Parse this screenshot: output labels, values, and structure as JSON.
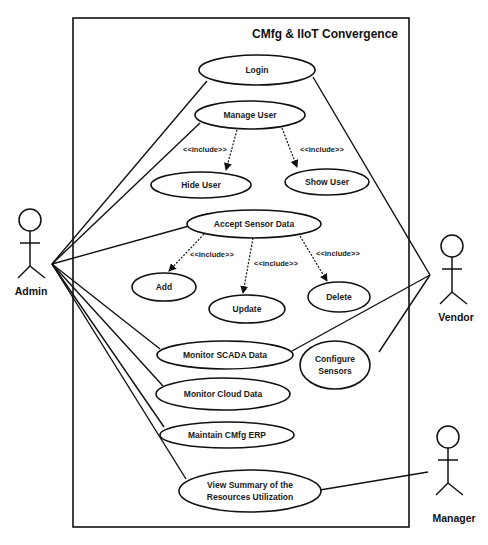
{
  "diagram": {
    "title": "CMfg & IIoT Convergence",
    "stroke_color": "#111111",
    "background": "#ffffff",
    "system_boundary": {
      "x": 73,
      "y": 18,
      "width": 336,
      "height": 509
    },
    "actors": [
      {
        "id": "admin",
        "label": "Admin",
        "head": {
          "cx": 30,
          "cy": 220
        },
        "label_pos": {
          "x": 31,
          "y": 295
        }
      },
      {
        "id": "vendor",
        "label": "Vendor",
        "head": {
          "cx": 452,
          "cy": 246
        },
        "label_pos": {
          "x": 456,
          "y": 321
        }
      },
      {
        "id": "manager",
        "label": "Manager",
        "head": {
          "cx": 448,
          "cy": 437
        },
        "label_pos": {
          "x": 454,
          "y": 522
        }
      }
    ],
    "use_cases": [
      {
        "id": "login",
        "label": "Login",
        "lines": [
          "Login"
        ],
        "cx": 257,
        "cy": 70,
        "rx": 58,
        "ry": 15
      },
      {
        "id": "manage_user",
        "label": "Manage User",
        "lines": [
          "Manage User"
        ],
        "cx": 250,
        "cy": 115,
        "rx": 55,
        "ry": 14
      },
      {
        "id": "hide_user",
        "label": "Hide User",
        "lines": [
          "Hide User"
        ],
        "cx": 201,
        "cy": 185,
        "rx": 50,
        "ry": 13
      },
      {
        "id": "show_user",
        "label": "Show User",
        "lines": [
          "Show User"
        ],
        "cx": 327,
        "cy": 182,
        "rx": 42,
        "ry": 13
      },
      {
        "id": "accept_sensor_data",
        "label": "Accept Sensor Data",
        "lines": [
          "Accept Sensor Data"
        ],
        "cx": 254,
        "cy": 224,
        "rx": 67,
        "ry": 14
      },
      {
        "id": "add",
        "label": "Add",
        "lines": [
          "Add"
        ],
        "cx": 164,
        "cy": 287,
        "rx": 32,
        "ry": 14
      },
      {
        "id": "update",
        "label": "Update",
        "lines": [
          "Update"
        ],
        "cx": 247,
        "cy": 309,
        "rx": 38,
        "ry": 14
      },
      {
        "id": "delete",
        "label": "Delete",
        "lines": [
          "Delete"
        ],
        "cx": 339,
        "cy": 297,
        "rx": 31,
        "ry": 15
      },
      {
        "id": "monitor_scada",
        "label": "Monitor SCADA Data",
        "lines": [
          "Monitor SCADA Data"
        ],
        "cx": 225,
        "cy": 355,
        "rx": 68,
        "ry": 14
      },
      {
        "id": "configure_sensors",
        "label": "Configure Sensors",
        "lines": [
          "Configure",
          "Sensors"
        ],
        "cx": 335,
        "cy": 365,
        "rx": 35,
        "ry": 24
      },
      {
        "id": "monitor_cloud",
        "label": "Monitor Cloud Data",
        "lines": [
          "Monitor Cloud Data"
        ],
        "cx": 223,
        "cy": 394,
        "rx": 67,
        "ry": 16
      },
      {
        "id": "maintain_erp",
        "label": "Maintain CMfg ERP",
        "lines": [
          "Maintain CMfg ERP"
        ],
        "cx": 227,
        "cy": 435,
        "rx": 67,
        "ry": 13
      },
      {
        "id": "view_summary",
        "label": "View Summary of the Resources Utilization",
        "lines": [
          "View Summary of the",
          "Resources Utilization"
        ],
        "cx": 250,
        "cy": 491,
        "rx": 71,
        "ry": 21
      }
    ],
    "include_relations": [
      {
        "from": "manage_user",
        "to": "hide_user",
        "label": "<<include>>",
        "x1": 237,
        "y1": 130,
        "x2": 226,
        "y2": 170,
        "label_x": 183,
        "label_y": 152
      },
      {
        "from": "manage_user",
        "to": "show_user",
        "label": "<<include>>",
        "x1": 282,
        "y1": 128,
        "x2": 297,
        "y2": 167,
        "label_x": 300,
        "label_y": 152
      },
      {
        "from": "accept_sensor_data",
        "to": "add",
        "label": "<<include>>",
        "x1": 204,
        "y1": 234,
        "x2": 169,
        "y2": 271,
        "label_x": 190,
        "label_y": 257
      },
      {
        "from": "accept_sensor_data",
        "to": "update",
        "label": "<<include>>",
        "x1": 253,
        "y1": 238,
        "x2": 243,
        "y2": 293,
        "label_x": 254,
        "label_y": 266
      },
      {
        "from": "accept_sensor_data",
        "to": "delete",
        "label": "<<include>>",
        "x1": 300,
        "y1": 236,
        "x2": 327,
        "y2": 281,
        "label_x": 316,
        "label_y": 256
      }
    ],
    "associations": [
      {
        "actor": "admin",
        "use_case": "login",
        "x1": 52,
        "y1": 264,
        "x2": 207,
        "y2": 81
      },
      {
        "actor": "admin",
        "use_case": "manage_user",
        "x1": 52,
        "y1": 264,
        "x2": 200,
        "y2": 123
      },
      {
        "actor": "admin",
        "use_case": "accept_sensor_data",
        "x1": 52,
        "y1": 264,
        "x2": 189,
        "y2": 226
      },
      {
        "actor": "admin",
        "use_case": "monitor_scada",
        "x1": 52,
        "y1": 264,
        "x2": 160,
        "y2": 349
      },
      {
        "actor": "admin",
        "use_case": "monitor_cloud",
        "x1": 52,
        "y1": 264,
        "x2": 163,
        "y2": 386
      },
      {
        "actor": "admin",
        "use_case": "maintain_erp",
        "x1": 52,
        "y1": 264,
        "x2": 164,
        "y2": 427
      },
      {
        "actor": "admin",
        "use_case": "view_summary",
        "x1": 52,
        "y1": 264,
        "x2": 186,
        "y2": 479
      },
      {
        "actor": "vendor",
        "use_case": "login",
        "x1": 430,
        "y1": 275,
        "x2": 313,
        "y2": 77
      },
      {
        "actor": "vendor",
        "use_case": "monitor_scada",
        "x1": 430,
        "y1": 275,
        "x2": 292,
        "y2": 351
      },
      {
        "actor": "vendor",
        "use_case": "configure_sensors",
        "x1": 430,
        "y1": 275,
        "x2": 379,
        "y2": 352
      },
      {
        "actor": "manager",
        "use_case": "view_summary",
        "x1": 428,
        "y1": 472,
        "x2": 320,
        "y2": 490
      }
    ]
  }
}
